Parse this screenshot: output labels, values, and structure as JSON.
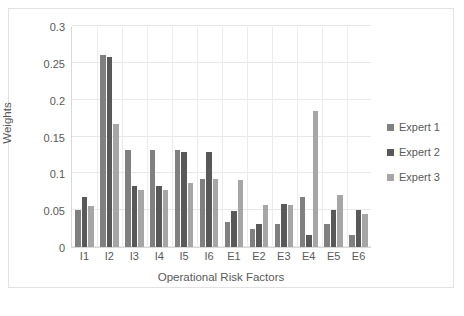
{
  "chart_data": {
    "type": "bar",
    "title": "",
    "xlabel": "Operational Risk Factors",
    "ylabel": "Weights",
    "categories": [
      "I1",
      "I2",
      "I3",
      "I4",
      "I5",
      "I6",
      "E1",
      "E2",
      "E3",
      "E4",
      "E5",
      "E6"
    ],
    "series": [
      {
        "name": "Expert 1",
        "color": "#808080",
        "values": [
          0.05,
          0.26,
          0.132,
          0.132,
          0.132,
          0.093,
          0.034,
          0.024,
          0.031,
          0.068,
          0.031,
          0.016
        ]
      },
      {
        "name": "Expert 2",
        "color": "#595959",
        "values": [
          0.068,
          0.258,
          0.083,
          0.083,
          0.129,
          0.129,
          0.049,
          0.031,
          0.059,
          0.016,
          0.05,
          0.05
        ]
      },
      {
        "name": "Expert 3",
        "color": "#a6a6a6",
        "values": [
          0.056,
          0.167,
          0.078,
          0.078,
          0.087,
          0.093,
          0.091,
          0.057,
          0.057,
          0.184,
          0.071,
          0.045
        ]
      }
    ],
    "ylim": [
      0,
      0.3
    ],
    "yticks": [
      0,
      0.05,
      0.1,
      0.15,
      0.2,
      0.25,
      0.3
    ],
    "ytick_labels": [
      "0",
      "0.05",
      "0.1",
      "0.15",
      "0.2",
      "0.25",
      "0.3"
    ],
    "grid": "horizontal-and-vertical",
    "legend_position": "right"
  }
}
